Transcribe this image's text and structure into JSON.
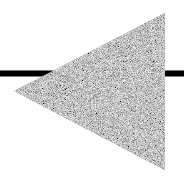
{
  "figure": {
    "description": "Left-pointing triangle with grey noise texture over a horizontal black line",
    "background": "#ffffff",
    "line": {
      "color": "#000000",
      "y": 73.5,
      "thickness": 6,
      "x_start": 0,
      "x_end": 184
    },
    "triangle": {
      "direction": "left",
      "points": [
        [
          165,
          13
        ],
        [
          165,
          170
        ],
        [
          14,
          91
        ]
      ],
      "fill_base": "#8c8c8c",
      "texture": "noise"
    }
  }
}
